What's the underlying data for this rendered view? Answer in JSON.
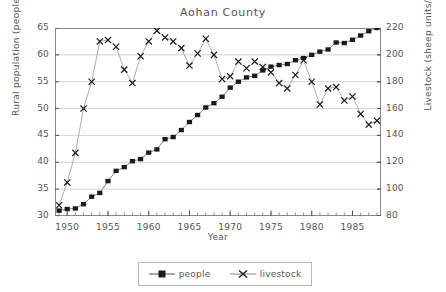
{
  "chart_data": {
    "type": "line",
    "title": "Aohan County",
    "xlabel": "Year",
    "ylabel": "Rural population (people/sq km)",
    "ylabel_right": "Livestock (sheep units/sq km)",
    "xlim": [
      1948.5,
      1988.5
    ],
    "ylim": [
      30,
      65
    ],
    "ylim_right": [
      80,
      220
    ],
    "yticks": [
      30,
      35,
      40,
      45,
      50,
      55,
      60,
      65
    ],
    "yticks_right": [
      80,
      100,
      120,
      140,
      160,
      180,
      200,
      220
    ],
    "xticks": [
      1950,
      1955,
      1960,
      1965,
      1970,
      1975,
      1980,
      1985
    ],
    "grid": "horizontal",
    "legend_position": "bottom-center",
    "x": [
      1949,
      1950,
      1951,
      1952,
      1953,
      1954,
      1955,
      1956,
      1957,
      1958,
      1959,
      1960,
      1961,
      1962,
      1963,
      1964,
      1965,
      1966,
      1967,
      1968,
      1969,
      1970,
      1971,
      1972,
      1973,
      1974,
      1975,
      1976,
      1977,
      1978,
      1979,
      1980,
      1981,
      1982,
      1983,
      1984,
      1985,
      1986,
      1987,
      1988
    ],
    "series": [
      {
        "name": "people",
        "axis": "left",
        "marker": "filled-square",
        "color": "#1a1a1a",
        "values": [
          31.0,
          31.3,
          31.4,
          32.2,
          33.6,
          34.3,
          36.5,
          38.4,
          39.1,
          40.2,
          40.6,
          41.8,
          42.4,
          44.3,
          44.7,
          46.0,
          47.5,
          48.8,
          50.2,
          51.0,
          52.2,
          53.9,
          55.0,
          55.8,
          56.1,
          57.1,
          57.8,
          58.1,
          58.3,
          59.0,
          59.4,
          60.0,
          60.6,
          61.0,
          62.3,
          62.2,
          62.8,
          63.6,
          64.4,
          65.0
        ]
      },
      {
        "name": "livestock",
        "axis": "right",
        "marker": "x",
        "color": "#1a1a1a",
        "values": [
          88.0,
          105.0,
          127.0,
          160.0,
          180.0,
          210.0,
          211.0,
          206.0,
          189.0,
          179.0,
          199.0,
          210.0,
          218.0,
          213.0,
          210.0,
          205.0,
          192.0,
          201.0,
          212.0,
          200.0,
          182.0,
          184.0,
          195.0,
          190.0,
          195.0,
          191.0,
          187.0,
          179.0,
          175.0,
          185.0,
          196.0,
          180.0,
          163.0,
          175.0,
          176.0,
          166.0,
          169.0,
          156.0,
          148.0,
          151.0
        ]
      }
    ]
  },
  "legend": {
    "items": [
      {
        "label": "people",
        "marker": "filled-square"
      },
      {
        "label": "livestock",
        "marker": "x"
      }
    ]
  }
}
